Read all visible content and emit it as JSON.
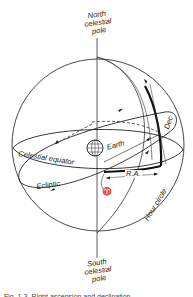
{
  "figure": {
    "labels": {
      "north_pole": [
        "North",
        "celestial",
        "pole"
      ],
      "south_pole": [
        "South",
        "celestial",
        "pole"
      ],
      "celestial_equator": "Celestial equator",
      "ecliptic": "Ecliptic",
      "earth": "Earth",
      "right_ascension": "R.A.",
      "declination": "Dec",
      "hour_circle": "Hour circle",
      "vernal_equinox": "♈"
    },
    "caption": "Fig. 1-3. Right ascension and declination."
  }
}
